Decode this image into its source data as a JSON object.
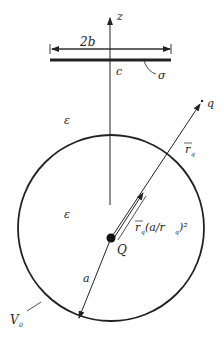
{
  "diagram": {
    "axis_label": "z",
    "width_label": "2b",
    "plate_label": "c",
    "charge_density_label": "σ",
    "epsilon_outer": "ε",
    "epsilon_inner": "ε",
    "charge_q": "q",
    "vector_rq": "r",
    "vector_rq_sub": "q",
    "image_vector_prefix": "r",
    "image_vector_sub": "q",
    "image_vector_suffix": "(a/r",
    "image_vector_sub2": "q",
    "image_vector_end": ")²",
    "image_charge": "Q",
    "radius_label": "a",
    "potential_label": "V",
    "potential_sub": "0"
  }
}
